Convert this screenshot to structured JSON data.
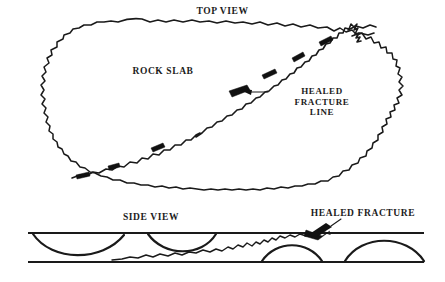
{
  "figure": {
    "kind": "geological-illustration",
    "background_color": "#ffffff",
    "ink_color": "#1a1a1a"
  },
  "labels": {
    "top_view": "TOP VIEW",
    "rock_slab": "ROCK SLAB",
    "healed_fracture_line": "HEALED\nFRACTURE\nLINE",
    "side_view": "SIDE VIEW",
    "healed_fracture_side": "HEALED FRACTURE"
  },
  "annotations": [
    {
      "name": "top-view-callout",
      "text": "HEALED FRACTURE LINE",
      "points_to": "healed fracture line in top view",
      "arrow_direction": "left"
    },
    {
      "name": "side-view-callout",
      "text": "HEALED FRACTURE",
      "points_to": "healed fracture trace in side view",
      "arrow_direction": "down-left"
    }
  ],
  "views": {
    "top": {
      "name": "TOP VIEW",
      "features": [
        "irregular rock slab outline",
        "jagged healed fracture line running diagonally"
      ]
    },
    "side": {
      "name": "SIDE VIEW",
      "features": [
        "upper slab surface line",
        "lower slab surface line",
        "scalloped concave arcs",
        "wavy healed fracture trace"
      ]
    }
  }
}
